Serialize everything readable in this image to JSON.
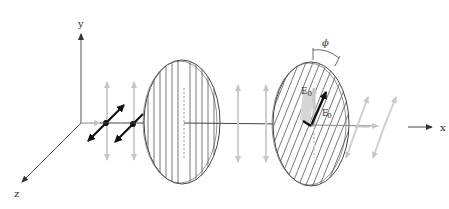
{
  "diagram": {
    "type": "polarization-through-two-polarizers",
    "axes": {
      "y_label": "y",
      "x_label": "x",
      "z_label": "z"
    },
    "polarizer_1": {
      "hatch": "vertical",
      "description": "vertical transmission axis"
    },
    "polarizer_2": {
      "hatch": "slanted",
      "description": "transmission axis rotated by angle phi"
    },
    "labels": {
      "angle": "ϕ",
      "field_incident": "E",
      "field_incident_sub": "0",
      "field_transmitted": "E",
      "field_transmitted_prime": "′",
      "field_transmitted_sub": "0"
    },
    "colors": {
      "line": "#333333",
      "light_arrow": "#c8c8c8",
      "dark_arrow": "#111111",
      "hatch": "#555555",
      "projection_fill": "#d9d9d9"
    }
  }
}
